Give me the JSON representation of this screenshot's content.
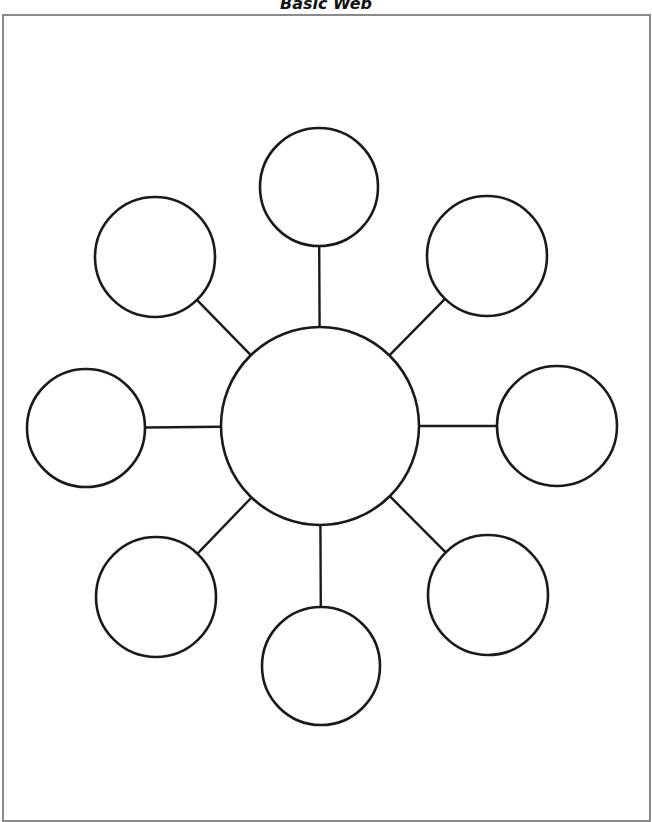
{
  "title": "Basic Web",
  "colors": {
    "stroke": "#1a1a1a",
    "frame": "#8a8a8a",
    "background": "#ffffff"
  },
  "center": {
    "cx": 320,
    "cy": 426,
    "r": 99
  },
  "nodes": [
    {
      "name": "node-top",
      "cx": 319,
      "cy": 187,
      "r": 59
    },
    {
      "name": "node-top-right",
      "cx": 487,
      "cy": 256,
      "r": 60
    },
    {
      "name": "node-right",
      "cx": 557,
      "cy": 426,
      "r": 60
    },
    {
      "name": "node-bottom-right",
      "cx": 488,
      "cy": 595,
      "r": 60
    },
    {
      "name": "node-bottom",
      "cx": 321,
      "cy": 666,
      "r": 59
    },
    {
      "name": "node-bottom-left",
      "cx": 156,
      "cy": 597,
      "r": 60
    },
    {
      "name": "node-left",
      "cx": 86,
      "cy": 428,
      "r": 59
    },
    {
      "name": "node-top-left",
      "cx": 155,
      "cy": 257,
      "r": 60
    }
  ]
}
